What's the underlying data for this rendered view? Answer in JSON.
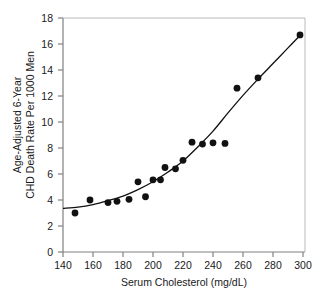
{
  "chart_data": {
    "type": "scatter",
    "title": "",
    "xlabel": "Serum Cholesterol (mg/dL)",
    "ylabel_line1": "Age-Adjusted 6-Year",
    "ylabel_line2": "CHD Death Rate Per 1000 Men",
    "xlim": [
      140,
      300
    ],
    "ylim": [
      0,
      18
    ],
    "xticks": [
      140,
      160,
      180,
      200,
      220,
      240,
      260,
      280,
      300
    ],
    "yticks": [
      0,
      2,
      4,
      6,
      8,
      10,
      12,
      14,
      16,
      18
    ],
    "grid": false,
    "legend": "none",
    "marker_color": "#111111",
    "line_color": "#111111",
    "axis_color": "#808080",
    "points": [
      {
        "x": 148,
        "y": 3.0
      },
      {
        "x": 158,
        "y": 4.0
      },
      {
        "x": 170,
        "y": 3.8
      },
      {
        "x": 176,
        "y": 3.9
      },
      {
        "x": 184,
        "y": 4.05
      },
      {
        "x": 190,
        "y": 5.4
      },
      {
        "x": 195,
        "y": 4.25
      },
      {
        "x": 200,
        "y": 5.55
      },
      {
        "x": 205,
        "y": 5.55
      },
      {
        "x": 208,
        "y": 6.5
      },
      {
        "x": 215,
        "y": 6.4
      },
      {
        "x": 220,
        "y": 7.05
      },
      {
        "x": 226,
        "y": 8.45
      },
      {
        "x": 233,
        "y": 8.3
      },
      {
        "x": 240,
        "y": 8.4
      },
      {
        "x": 248,
        "y": 8.35
      },
      {
        "x": 256,
        "y": 12.6
      },
      {
        "x": 270,
        "y": 13.4
      },
      {
        "x": 298,
        "y": 16.7
      }
    ],
    "fit_curve": [
      {
        "x": 140,
        "y": 3.35
      },
      {
        "x": 150,
        "y": 3.45
      },
      {
        "x": 160,
        "y": 3.65
      },
      {
        "x": 170,
        "y": 3.95
      },
      {
        "x": 180,
        "y": 4.3
      },
      {
        "x": 190,
        "y": 4.8
      },
      {
        "x": 200,
        "y": 5.4
      },
      {
        "x": 210,
        "y": 6.15
      },
      {
        "x": 220,
        "y": 7.0
      },
      {
        "x": 230,
        "y": 8.1
      },
      {
        "x": 240,
        "y": 9.3
      },
      {
        "x": 250,
        "y": 10.7
      },
      {
        "x": 260,
        "y": 12.05
      },
      {
        "x": 270,
        "y": 13.3
      },
      {
        "x": 280,
        "y": 14.5
      },
      {
        "x": 290,
        "y": 15.7
      },
      {
        "x": 298,
        "y": 16.65
      }
    ]
  }
}
